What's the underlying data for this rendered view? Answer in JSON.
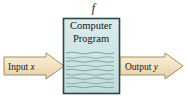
{
  "diagram": {
    "title_label": "f",
    "box": {
      "line1": "Computer",
      "line2": "Program",
      "fill_color": "#cfe4e4",
      "border_color": "#2f4f4f",
      "code_line_color": "#6f9a9a"
    },
    "input_arrow": {
      "label_prefix": "Input",
      "label_var": "x",
      "fill_color": "#f2e3c2",
      "border_color": "#9a8348",
      "direction": "right"
    },
    "output_arrow": {
      "label_prefix": "Output",
      "label_var": "y",
      "fill_color": "#f2e3c2",
      "border_color": "#9a8348",
      "direction": "right"
    },
    "background_color": "#ffffff"
  }
}
